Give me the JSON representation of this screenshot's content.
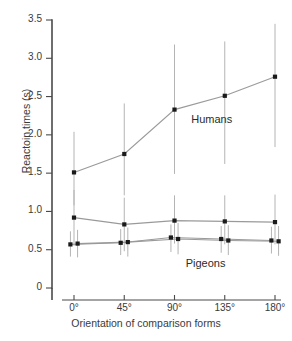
{
  "chart_data": {
    "type": "line",
    "title": "",
    "xlabel": "Orientation of comparison forms",
    "ylabel": "Reactoin times (s)",
    "categories": [
      "0°",
      "45°",
      "90°",
      "135°",
      "180°"
    ],
    "x": [
      0,
      45,
      90,
      135,
      180
    ],
    "xlim": [
      0,
      180
    ],
    "ylim": [
      0,
      3.5
    ],
    "yticks": [
      0,
      0.5,
      1.0,
      1.5,
      2.0,
      2.5,
      3.0,
      3.5
    ],
    "ytick_labels": [
      "0",
      "0.5",
      "1.0",
      "1.5",
      "2.0",
      "2.5",
      "3.0",
      "3.5"
    ],
    "xtick_labels": [
      "0°",
      "45°",
      "90°",
      "135°",
      "180°"
    ],
    "grid": false,
    "legend": "inline-annotations",
    "error_bars": "vertical",
    "marker": "filled-square",
    "series": [
      {
        "name": "Humans",
        "values": [
          1.51,
          1.75,
          2.33,
          2.51,
          2.76
        ],
        "err_low": [
          1.08,
          1.21,
          1.49,
          1.62,
          1.84
        ],
        "err_high": [
          2.04,
          2.41,
          3.18,
          3.22,
          3.45
        ],
        "x_offset": 0
      },
      {
        "name": "Pigeons upper",
        "values": [
          0.92,
          0.83,
          0.88,
          0.87,
          0.86
        ],
        "err_low": [
          0.55,
          0.48,
          0.58,
          0.57,
          0.57
        ],
        "err_high": [
          1.28,
          1.18,
          1.21,
          1.21,
          1.22
        ],
        "x_offset": 0
      },
      {
        "name": "Pigeons lower a",
        "values": [
          0.57,
          0.59,
          0.66,
          0.64,
          0.62
        ],
        "err_low": [
          0.41,
          0.43,
          0.47,
          0.46,
          0.45
        ],
        "err_high": [
          0.74,
          0.77,
          0.83,
          0.81,
          0.8
        ],
        "x_offset": -3.2
      },
      {
        "name": "Pigeons lower b",
        "values": [
          0.58,
          0.6,
          0.64,
          0.62,
          0.61
        ],
        "err_low": [
          0.4,
          0.41,
          0.44,
          0.43,
          0.42
        ],
        "err_high": [
          0.76,
          0.79,
          0.85,
          0.82,
          0.81
        ],
        "x_offset": 3.2
      }
    ],
    "annotations": [
      {
        "text": "Humans",
        "x": 105,
        "y": 2.18
      },
      {
        "text": "Pigeons",
        "x": 100,
        "y": 0.3
      }
    ]
  },
  "axes": {
    "y_title": "Reactoin times (s)",
    "x_title": "Orientation of comparison forms"
  },
  "colors": {
    "axis": "#4a4a4a",
    "marker": "#1a1a1a",
    "line": "#9a9a9a",
    "error_bar": "#b4b4b4",
    "text": "#3a3a3a"
  }
}
